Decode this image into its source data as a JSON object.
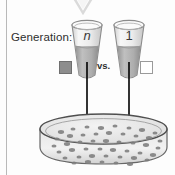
{
  "figure": {
    "label": "Generation:",
    "vs_text": "vs.",
    "colors": {
      "filled_square": "#8d8d8d",
      "empty_square": "#ffffff",
      "square_outline": "#9a9a9a",
      "arrow": "#000000",
      "tube_liquid": "#a8a8a8",
      "tube_outline": "#8c8c8c",
      "dish_surface": "#e9e9e9",
      "dish_outline": "#555555",
      "colony": "#7e7e7e",
      "background": "#fdfdfd",
      "rule": "#b9b9b9"
    }
  },
  "tubes": [
    {
      "id": "tube-generation-n",
      "label": "n",
      "marker": "filled-square",
      "arrow": "down-arrow-left"
    },
    {
      "id": "tube-generation-1",
      "label": "1",
      "marker": "empty-square",
      "arrow": "down-arrow-right"
    }
  ],
  "legend": [
    {
      "name": "filled-square-marker",
      "label": "",
      "style": "filled"
    },
    {
      "name": "empty-square-marker",
      "label": "",
      "style": "empty"
    }
  ],
  "dish": {
    "name": "petri-dish",
    "colony_count": 46,
    "colonies": [
      [
        18,
        16
      ],
      [
        30,
        13
      ],
      [
        44,
        11
      ],
      [
        58,
        12
      ],
      [
        72,
        10
      ],
      [
        86,
        12
      ],
      [
        99,
        14
      ],
      [
        112,
        17
      ],
      [
        14,
        23
      ],
      [
        27,
        20
      ],
      [
        40,
        19
      ],
      [
        53,
        18
      ],
      [
        66,
        17
      ],
      [
        80,
        18
      ],
      [
        93,
        20
      ],
      [
        106,
        22
      ],
      [
        117,
        25
      ],
      [
        11,
        30
      ],
      [
        24,
        28
      ],
      [
        37,
        26
      ],
      [
        50,
        25
      ],
      [
        63,
        25
      ],
      [
        76,
        26
      ],
      [
        90,
        27
      ],
      [
        103,
        29
      ],
      [
        115,
        32
      ],
      [
        16,
        36
      ],
      [
        29,
        34
      ],
      [
        43,
        33
      ],
      [
        57,
        33
      ],
      [
        70,
        34
      ],
      [
        84,
        35
      ],
      [
        97,
        37
      ],
      [
        110,
        39
      ],
      [
        22,
        42
      ],
      [
        36,
        41
      ],
      [
        49,
        40
      ],
      [
        63,
        40
      ],
      [
        77,
        41
      ],
      [
        91,
        42
      ],
      [
        104,
        44
      ],
      [
        31,
        47
      ],
      [
        45,
        46
      ],
      [
        59,
        46
      ],
      [
        73,
        47
      ],
      [
        87,
        48
      ]
    ]
  },
  "top_element": {
    "name": "cut-off-tube-tip",
    "description": "faint V-shaped tube tip at top edge"
  }
}
